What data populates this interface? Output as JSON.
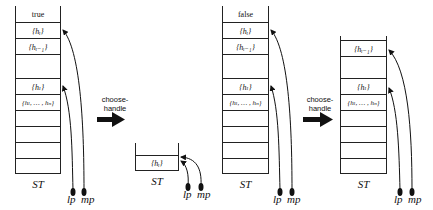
{
  "diagram": {
    "title": "",
    "stacks": [
      {
        "id": "stack-1",
        "label": "ST",
        "cells": [
          {
            "text": "true",
            "math": false
          },
          {
            "text": "{h_i}",
            "display": "{hᵢ}",
            "math": true
          },
          {
            "text": "{h_{i-1}}",
            "display": "{hᵢ₋₁}",
            "math": true
          },
          {
            "text": "",
            "math": false
          },
          {
            "text": "{h_l}",
            "display": "{hₗ}",
            "math": true
          },
          {
            "text": "{h_l, ..., h_n}",
            "display": "{hₗ, … , hₙ}",
            "math": true
          },
          {
            "text": "",
            "math": false
          },
          {
            "text": "",
            "math": false
          },
          {
            "text": "",
            "math": false
          },
          {
            "text": "",
            "math": false
          }
        ],
        "pointers": [
          {
            "name": "lp",
            "target": "{h_l}"
          },
          {
            "name": "mp",
            "target": "{h_i}"
          }
        ]
      },
      {
        "id": "stack-2",
        "label": "ST",
        "cells": [
          {
            "text": "{h_i}",
            "display": "{hᵢ}",
            "math": true
          }
        ],
        "pointers": [
          {
            "name": "lp",
            "target": "{h_i}"
          },
          {
            "name": "mp",
            "target": "{h_i}"
          }
        ]
      },
      {
        "id": "stack-3",
        "label": "ST",
        "cells": [
          {
            "text": "false",
            "math": false
          },
          {
            "text": "{h_i}",
            "display": "{hᵢ}",
            "math": true
          },
          {
            "text": "{h_{i-1}}",
            "display": "{hᵢ₋₁}",
            "math": true
          },
          {
            "text": "",
            "math": false
          },
          {
            "text": "{h_l}",
            "display": "{hₗ}",
            "math": true
          },
          {
            "text": "{h_l, ..., h_n}",
            "display": "{hₗ, … , hₙ}",
            "math": true
          },
          {
            "text": "",
            "math": false
          },
          {
            "text": "",
            "math": false
          },
          {
            "text": "",
            "math": false
          },
          {
            "text": "",
            "math": false
          }
        ],
        "pointers": [
          {
            "name": "lp",
            "target": "{h_l}"
          },
          {
            "name": "mp",
            "target": "{h_i}"
          }
        ]
      },
      {
        "id": "stack-4",
        "label": "ST",
        "cells": [
          {
            "text": "{h_{i-1}}",
            "display": "{hᵢ₋₁}",
            "math": true
          },
          {
            "text": "",
            "math": false
          },
          {
            "text": "{h_l}",
            "display": "{hₗ}",
            "math": true
          },
          {
            "text": "{h_l, ..., h_n}",
            "display": "{hₗ, … , hₙ}",
            "math": true
          },
          {
            "text": "",
            "math": false
          },
          {
            "text": "",
            "math": false
          },
          {
            "text": "",
            "math": false
          },
          {
            "text": "",
            "math": false
          }
        ],
        "pointers": [
          {
            "name": "lp",
            "target": "{h_l}"
          },
          {
            "name": "mp",
            "target": "{h_{i-1}}"
          }
        ]
      }
    ],
    "transitions": [
      {
        "from": "stack-1",
        "to": "stack-2",
        "label_line1": "choose-",
        "label_line2": "handle"
      },
      {
        "from": "stack-3",
        "to": "stack-4",
        "label_line1": "choose-",
        "label_line2": "handle"
      }
    ],
    "pointer_labels": {
      "lp": "lp",
      "mp": "mp"
    }
  }
}
